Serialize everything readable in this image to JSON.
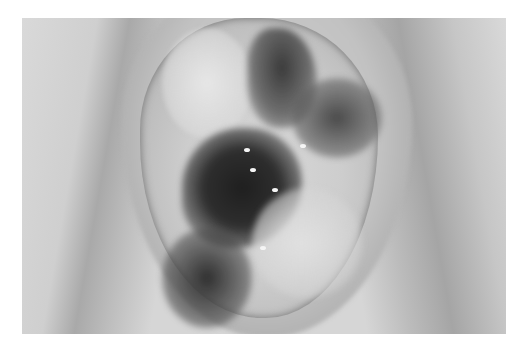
{
  "image": {
    "description": "Grayscale clinical photograph of a wound with dark necrotic tissue and lighter granulation areas",
    "colors": {
      "background": "#ffffff",
      "photo_base": "#d6d6d6",
      "dark_tissue": "#1f1f1f",
      "light_tissue": "#e0e0e0"
    }
  }
}
